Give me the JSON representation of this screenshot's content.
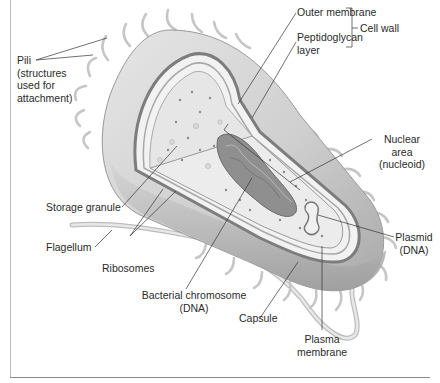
{
  "figure": {
    "labels": {
      "pili": {
        "line1": "Pili",
        "line2": "(structures",
        "line3": "used for",
        "line4": "attachment)"
      },
      "outer_membrane": "Outer membrane",
      "peptidoglycan": {
        "line1": "Peptidoglycan",
        "line2": "layer"
      },
      "cell_wall": "Cell wall",
      "nuclear_area": {
        "line1": "Nuclear",
        "line2": "area",
        "line3": "(nucleoid)"
      },
      "storage_granule": "Storage granule",
      "flagellum": "Flagellum",
      "ribosomes": "Ribosomes",
      "plasmid": {
        "line1": "Plasmid",
        "line2": "(DNA)"
      },
      "bacterial_chromosome": {
        "line1": "Bacterial chromosome",
        "line2": "(DNA)"
      },
      "capsule": "Capsule",
      "plasma_membrane": {
        "line1": "Plasma",
        "line2": "membrane"
      }
    },
    "colors": {
      "capsule_fill": "#d9d9d9",
      "cell_wall_stroke": "#7a7a7a",
      "cytoplasm_fill": "#eeeeee",
      "chromosome_fill": "#8f8f8f",
      "pili_stroke": "#c8c8c8",
      "leader_line": "#333333"
    }
  }
}
